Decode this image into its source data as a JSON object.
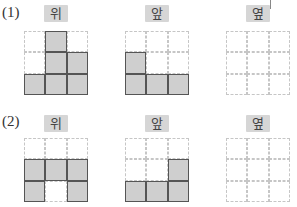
{
  "problems": [
    {
      "number": "(1)",
      "views": [
        {
          "label": "위",
          "grid": [
            [
              0,
              1,
              0
            ],
            [
              0,
              1,
              1
            ],
            [
              1,
              1,
              1
            ]
          ]
        },
        {
          "label": "앞",
          "grid": [
            [
              0,
              0,
              0
            ],
            [
              1,
              0,
              0
            ],
            [
              1,
              1,
              1
            ]
          ]
        },
        {
          "label": "옆",
          "grid": [
            [
              0,
              0,
              0
            ],
            [
              0,
              0,
              0
            ],
            [
              0,
              0,
              0
            ]
          ]
        }
      ]
    },
    {
      "number": "(2)",
      "views": [
        {
          "label": "위",
          "grid": [
            [
              0,
              0,
              0
            ],
            [
              1,
              1,
              1
            ],
            [
              1,
              0,
              1
            ]
          ]
        },
        {
          "label": "앞",
          "grid": [
            [
              0,
              0,
              0
            ],
            [
              0,
              0,
              1
            ],
            [
              1,
              1,
              1
            ]
          ]
        },
        {
          "label": "옆",
          "grid": [
            [
              0,
              0,
              0
            ],
            [
              0,
              0,
              0
            ],
            [
              0,
              0,
              0
            ]
          ]
        }
      ]
    }
  ],
  "colors": {
    "filled": "#cfcfcf",
    "border": "#555555",
    "dashed": "#c6c6c6",
    "badge": "#d6d6d6"
  }
}
